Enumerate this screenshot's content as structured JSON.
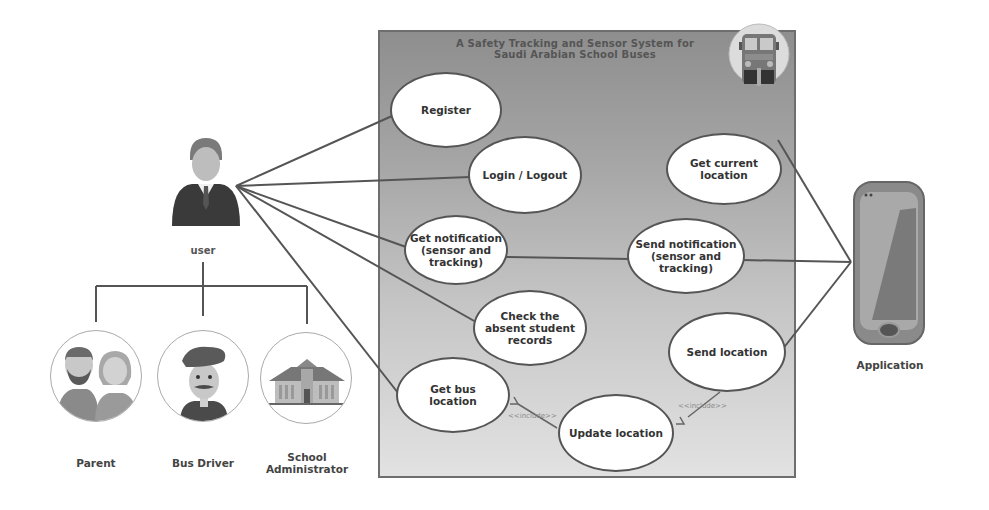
{
  "system": {
    "title_line1": "A Safety Tracking and Sensor System for",
    "title_line2": "Saudi Arabian School Buses",
    "icon": "school-bus-icon"
  },
  "actors": {
    "user": {
      "label": "user",
      "icon": "businessman-icon"
    },
    "parent": {
      "label": "Parent",
      "icon": "parents-couple-icon"
    },
    "bus_driver": {
      "label": "Bus Driver",
      "icon": "bus-driver-icon"
    },
    "school_admin": {
      "label_line1": "School",
      "label_line2": "Administrator",
      "icon": "school-building-icon"
    },
    "application": {
      "label": "Application",
      "icon": "mobile-phone-icon"
    }
  },
  "use_cases": {
    "register": "Register",
    "login_logout": "Login / Logout",
    "get_notification": {
      "line1": "Get notification",
      "line2": "(sensor and",
      "line3": "tracking)"
    },
    "check_absent": {
      "line1": "Check the",
      "line2": "absent student",
      "line3": "records"
    },
    "get_bus_location": {
      "line1": "Get bus",
      "line2": "location"
    },
    "update_location": "Update location",
    "get_current_location": {
      "line1": "Get current",
      "line2": "location"
    },
    "send_notification": {
      "line1": "Send notification",
      "line2": "(sensor and",
      "line3": "tracking)"
    },
    "send_location": "Send location"
  },
  "relations": {
    "include_left": "<<include>>",
    "include_right": "<<include>>"
  },
  "colors": {
    "box_top": "#8e8e8e",
    "box_bottom": "#e2e2e2",
    "line": "#555555",
    "ellipse_fill": "#ffffff"
  }
}
